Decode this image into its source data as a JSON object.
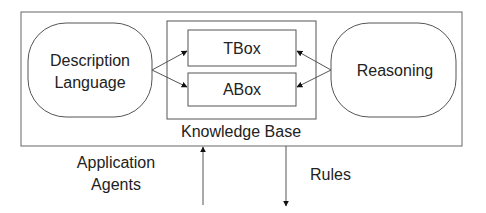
{
  "diagram": {
    "outer_box": {},
    "description_language": {
      "line1": "Description",
      "line2": "Language"
    },
    "reasoning": {
      "label": "Reasoning"
    },
    "knowledge_base": {
      "label": "Knowledge Base",
      "tbox": "TBox",
      "abox": "ABox"
    },
    "application_agents": {
      "line1": "Application",
      "line2": "Agents"
    },
    "rules": {
      "label": "Rules"
    }
  },
  "colors": {
    "stroke": "#555555",
    "text": "#222222",
    "arrowhead": "#111111"
  }
}
